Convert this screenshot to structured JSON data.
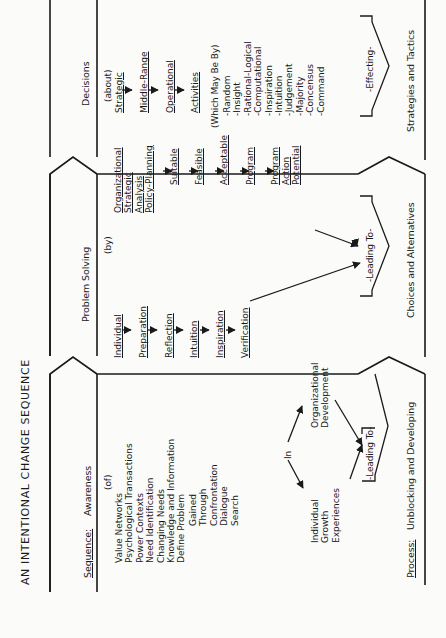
{
  "title": "AN INTENTIONAL CHANGE SEQUENCE",
  "sequence_label": "Sequence:",
  "process_label": "Process:",
  "process_value": "Unblocking and Developing",
  "stages": {
    "awareness": {
      "header": "Awareness",
      "qualifier": "(of)",
      "items": [
        "Value Networks",
        "Psychological Transactions",
        "Power Contexts",
        "Need Identification",
        "Changing Needs",
        "Knowledge and Information",
        "Define Problem"
      ],
      "gained_items": [
        "Gained",
        "Through",
        "Confrontation",
        "Dialogue",
        "Search"
      ],
      "in_label": "In",
      "individual": [
        "Individual",
        "Growth",
        "Experiences"
      ],
      "organizational": [
        "Organizational",
        "Development"
      ],
      "leading_to": "-Leading To-"
    },
    "problem_solving": {
      "header": "Problem Solving",
      "qualifier": "(by)",
      "individual_chain": [
        "Individual",
        "Preparation",
        "Reflection",
        "Intuition",
        "Inspiration",
        "Verification"
      ],
      "organizational_chain": [
        "Organizational Strategic Analysis Policy-Planning",
        "Suitable",
        "Feasible",
        "Acceptable",
        "Program",
        "Program Action Potential"
      ],
      "organizational_head": [
        "Organizational",
        "Strategic",
        "Analysis",
        "Policy-Planning"
      ],
      "program_action": [
        "Program",
        "Action",
        "Potential"
      ],
      "leading_to": "-Leading To-",
      "result": "Choices and Alternatives"
    },
    "decisions": {
      "header": "Decisions",
      "qualifier": "(about)",
      "chain": [
        "Strategic",
        "Middle-Range",
        "Operational",
        "Activities"
      ],
      "methods_label": "(Which May Be By)",
      "methods": [
        "-Random",
        "-Insight",
        "-Rational-Logical",
        "-Computational",
        "-Inspiration",
        "-Intuition",
        "-Judgement",
        "-Majority",
        "-Concensus",
        "-Command"
      ],
      "effecting": "-Effecting-",
      "result": "Strategies and Tactics"
    }
  }
}
